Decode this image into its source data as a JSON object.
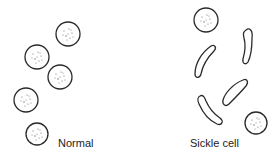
{
  "figure": {
    "panels": [
      {
        "id": "normal",
        "label": "Normal",
        "cell_type": "round red blood cell",
        "cells": [
          {
            "shape": "circle",
            "cx": 68,
            "cy": 34,
            "r": 12
          },
          {
            "shape": "circle",
            "cx": 37,
            "cy": 57,
            "r": 12
          },
          {
            "shape": "circle",
            "cx": 60,
            "cy": 77,
            "r": 12
          },
          {
            "shape": "circle",
            "cx": 26,
            "cy": 100,
            "r": 12
          },
          {
            "shape": "circle",
            "cx": 37,
            "cy": 134,
            "r": 11
          }
        ]
      },
      {
        "id": "sickle",
        "label": "Sickle cell",
        "cell_type": "sickle-shaped red blood cell",
        "cells": [
          {
            "shape": "circle",
            "cx": 206,
            "cy": 20,
            "r": 12
          },
          {
            "shape": "sickle",
            "from": [
              213,
              46
            ],
            "to": [
              196,
              77
            ]
          },
          {
            "shape": "sickle",
            "from": [
              247,
              29
            ],
            "to": [
              245,
              63
            ]
          },
          {
            "shape": "sickle",
            "from": [
              245,
              80
            ],
            "to": [
              224,
              105
            ]
          },
          {
            "shape": "sickle",
            "from": [
              199,
              96
            ],
            "to": [
              220,
              124
            ]
          },
          {
            "shape": "circle",
            "cx": 256,
            "cy": 123,
            "r": 11
          }
        ]
      }
    ],
    "colors": {
      "outline": "#2a2a2a",
      "stipple": "#6a6a6a",
      "background": "#ffffff"
    }
  }
}
